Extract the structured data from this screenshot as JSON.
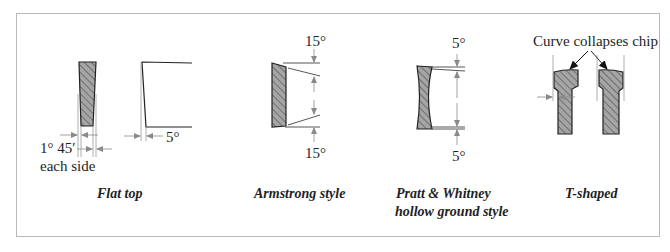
{
  "figure": {
    "type": "technical-diagram",
    "frame_color": "#b8b8b8",
    "hatch_fill": "#9a9a9a",
    "outline_color": "#222222",
    "dimension_color": "#8a8a8a"
  },
  "panels": [
    {
      "id": "flat-top",
      "caption": "Flat top",
      "annotations": {
        "side_clearance_value": "1° 45′",
        "side_clearance_note": "each side",
        "end_clearance": "5°"
      }
    },
    {
      "id": "armstrong",
      "caption": "Armstrong style",
      "annotations": {
        "top_angle": "15°",
        "bottom_angle": "15°"
      }
    },
    {
      "id": "pratt-whitney",
      "caption_line1": "Pratt & Whitney",
      "caption_line2": "hollow ground style",
      "annotations": {
        "top_angle": "5°",
        "bottom_angle": "5°"
      }
    },
    {
      "id": "t-shaped",
      "caption": "T-shaped",
      "annotations": {
        "callout": "Curve collapses chip"
      }
    }
  ]
}
